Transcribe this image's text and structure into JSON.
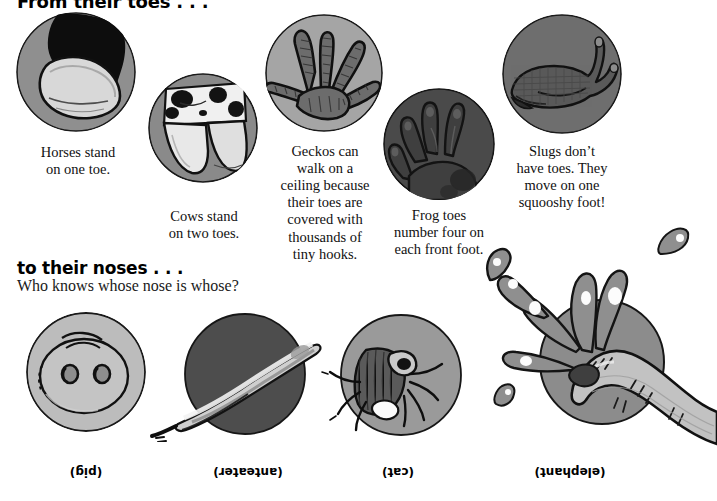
{
  "page": {
    "width": 717,
    "height": 501,
    "background": "#ffffff"
  },
  "sections": {
    "toes": {
      "heading": "From their toes . . ."
    },
    "noses": {
      "heading": "to their noses . . .",
      "subheading": "Who knows whose nose is whose?"
    }
  },
  "toe_items": [
    {
      "id": "horse",
      "icon": "horse-hoof-icon",
      "caption_lines": [
        "Horses stand",
        "on one toe."
      ],
      "circle_fill": "#8f8f8f"
    },
    {
      "id": "cow",
      "icon": "cow-hoof-icon",
      "caption_lines": [
        "Cows stand",
        "on two toes."
      ],
      "circle_fill": "#8a8a8a"
    },
    {
      "id": "gecko",
      "icon": "gecko-foot-icon",
      "caption_lines": [
        "Geckos can",
        "walk on a",
        "ceiling because",
        "their toes are",
        "covered with",
        "thousands of",
        "tiny hooks."
      ],
      "circle_fill": "#a5a5a5"
    },
    {
      "id": "frog",
      "icon": "frog-foot-icon",
      "caption_lines": [
        "Frog toes",
        "number four on",
        "each front foot."
      ],
      "circle_fill": "#4a4a4a"
    },
    {
      "id": "slug",
      "icon": "slug-icon",
      "caption_lines": [
        "Slugs don’t",
        "have toes. They",
        "move on one",
        "squooshy foot!"
      ],
      "circle_fill": "#6e6e6e"
    }
  ],
  "nose_items": [
    {
      "id": "pig",
      "icon": "pig-snout-icon",
      "answer": "(pig)",
      "circle_fill": "#b9b9b9"
    },
    {
      "id": "anteater",
      "icon": "anteater-snout-icon",
      "answer": "(anteater)",
      "circle_fill": "#4d4d4d"
    },
    {
      "id": "cat",
      "icon": "cat-nose-icon",
      "answer": "(cat)",
      "circle_fill": "#9a9a9a"
    },
    {
      "id": "elephant",
      "icon": "elephant-trunk-icon",
      "answer": "(elephant)",
      "circle_fill": "#8c8c8c"
    }
  ],
  "colors": {
    "ink": "#000000",
    "paper": "#ffffff",
    "light_gray": "#d4d4d4",
    "mid_gray": "#8f8f8f",
    "dark_gray": "#4a4a4a",
    "highlight": "#f2f2f2"
  }
}
